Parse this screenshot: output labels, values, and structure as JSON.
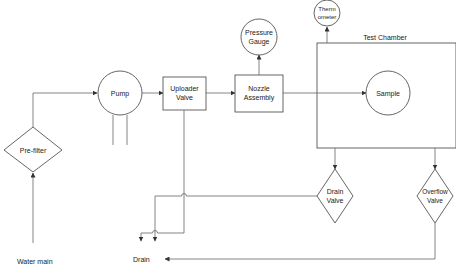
{
  "diagram": {
    "type": "process-flow",
    "nodes": {
      "water_main": {
        "label": "Water main",
        "shape": "text"
      },
      "prefilter": {
        "label": "Pre-filter",
        "shape": "diamond"
      },
      "pump": {
        "label": "Pump",
        "shape": "circle"
      },
      "uploader_valve": {
        "line1": "Uploader",
        "line2": "Valve",
        "shape": "rectangle"
      },
      "nozzle_assembly": {
        "line1": "Nozzle",
        "line2": "Assembly",
        "shape": "rectangle"
      },
      "pressure_gauge": {
        "line1": "Pressure",
        "line2": "Gauge",
        "shape": "circle"
      },
      "thermometer": {
        "line1": "Therm",
        "line2": "ometer",
        "shape": "circle"
      },
      "test_chamber": {
        "label": "Test Chamber",
        "shape": "rectangle"
      },
      "sample": {
        "label": "Sample",
        "shape": "circle"
      },
      "drain_valve": {
        "line1": "Drain",
        "line2": "Valve",
        "shape": "diamond"
      },
      "overflow_valve": {
        "line1": "Overflow",
        "line2": "Valve",
        "shape": "diamond"
      },
      "drain": {
        "label": "Drain",
        "shape": "text"
      }
    },
    "edges": [
      {
        "from": "Water main",
        "to": "Pre-filter"
      },
      {
        "from": "Pre-filter",
        "to": "Pump"
      },
      {
        "from": "Pump",
        "to": "Uploader Valve"
      },
      {
        "from": "Uploader Valve",
        "to": "Nozzle Assembly"
      },
      {
        "from": "Nozzle Assembly",
        "to": "Pressure Gauge"
      },
      {
        "from": "Nozzle Assembly",
        "to": "Sample"
      },
      {
        "from": "Test Chamber",
        "to": "Thermometer"
      },
      {
        "from": "Test Chamber",
        "to": "Drain Valve"
      },
      {
        "from": "Test Chamber",
        "to": "Overflow Valve"
      },
      {
        "from": "Uploader Valve",
        "to": "Drain"
      },
      {
        "from": "Drain Valve",
        "to": "Drain"
      },
      {
        "from": "Overflow Valve",
        "to": "Drain"
      }
    ],
    "colors": {
      "line": "#666666",
      "shape_stroke": "#555555",
      "text": "#222222",
      "background": "#ffffff"
    }
  }
}
